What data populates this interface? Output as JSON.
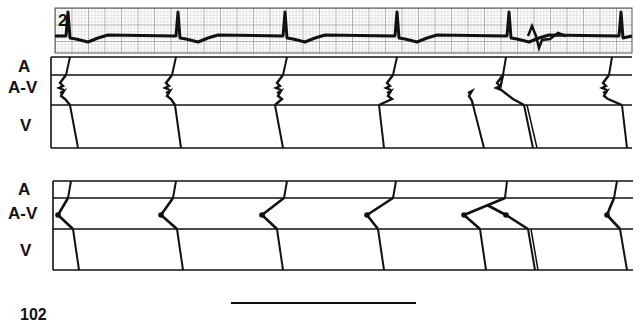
{
  "figure": {
    "ecg_strip": {
      "lead_label": "2",
      "grid_color": "#9a9a9a",
      "trace_color": "#111111",
      "bounds": {
        "x": 55,
        "y": 8,
        "w": 577,
        "h": 45
      },
      "baseline_y": 36,
      "beats_x": [
        68,
        178,
        285,
        397,
        509,
        621
      ],
      "premature_beat_x": 536
    },
    "ladder_top": {
      "row_labels": [
        "A",
        "A-V",
        "V"
      ],
      "lines_y": [
        57,
        75,
        105,
        148
      ],
      "x_left": 51,
      "x_right": 632,
      "note": "Ladder diagram with concealed/dual AV conduction (zigzag in A-V level)",
      "beats": [
        {
          "a_top": 70,
          "a_bot": 66,
          "av_end": 68,
          "v_end": 78
        },
        {
          "a_top": 176,
          "a_bot": 172,
          "av_end": 173,
          "v_end": 181
        },
        {
          "a_top": 287,
          "a_bot": 283,
          "av_end": 273,
          "v_end": 283
        },
        {
          "a_top": 397,
          "a_bot": 393,
          "av_end": 377,
          "v_end": 384
        },
        {
          "a_top": 506,
          "a_bot": 503,
          "av_end": 528,
          "v_end": 535
        },
        {
          "a_top": 612,
          "a_bot": 609,
          "av_end": 620,
          "v_end": 627
        }
      ],
      "extra_v_lines": [
        {
          "x_top": 471,
          "x_bot": 484
        }
      ]
    },
    "ladder_bottom": {
      "row_labels": [
        "A",
        "A-V",
        "V"
      ],
      "lines_y": [
        181,
        198,
        229,
        270
      ],
      "x_left": 53,
      "x_right": 633,
      "beats": [
        {
          "a_top": 71,
          "a_bot": 68,
          "pivot_x": 58,
          "pivot_y": 215,
          "av_end": 73,
          "v_end": 79
        },
        {
          "a_top": 176,
          "a_bot": 173,
          "pivot_x": 161,
          "pivot_y": 215,
          "av_end": 177,
          "v_end": 183
        },
        {
          "a_top": 287,
          "a_bot": 284,
          "pivot_x": 262,
          "pivot_y": 215,
          "av_end": 277,
          "v_end": 283
        },
        {
          "a_top": 396,
          "a_bot": 393,
          "pivot_x": 367,
          "pivot_y": 215,
          "av_end": 378,
          "v_end": 384
        },
        {
          "a_top": 507,
          "a_bot": 505,
          "pivot_x": 464,
          "pivot_y": 215,
          "av_end": 480,
          "v_end": 486
        },
        {
          "a_top": 617,
          "a_bot": 614,
          "pivot_x": 607,
          "pivot_y": 215,
          "av_end": 620,
          "v_end": 627
        }
      ],
      "extra_path": {
        "from_x": 487,
        "from_y": 205,
        "mid_x": 506,
        "mid_y": 215,
        "to_x": 528,
        "to_y": 229,
        "v_end": 537
      }
    },
    "scale_bar": {
      "x1": 231,
      "x2": 416,
      "y": 303
    },
    "figure_number": "102"
  }
}
